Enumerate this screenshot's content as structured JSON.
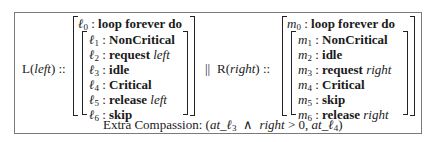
{
  "left_process": {
    "label_name": "L",
    "label_arg": "left",
    "label_suffix": " ::",
    "outer": {
      "loc": "ℓ",
      "idx": "0",
      "text": "loop forever do"
    },
    "inner": [
      {
        "loc": "ℓ",
        "idx": "1",
        "stmt": "NonCritical",
        "arg": ""
      },
      {
        "loc": "ℓ",
        "idx": "2",
        "stmt": "request",
        "arg": "left"
      },
      {
        "loc": "ℓ",
        "idx": "3",
        "stmt": "idle",
        "arg": ""
      },
      {
        "loc": "ℓ",
        "idx": "4",
        "stmt": "Critical",
        "arg": ""
      },
      {
        "loc": "ℓ",
        "idx": "5",
        "stmt": "release",
        "arg": "left"
      },
      {
        "loc": "ℓ",
        "idx": "6",
        "stmt": "skip",
        "arg": ""
      }
    ]
  },
  "parallel_operator": "||",
  "right_process": {
    "label_name": "R",
    "label_arg": "right",
    "label_suffix": " ::",
    "outer": {
      "loc": "m",
      "idx": "0",
      "text": "loop forever do"
    },
    "inner": [
      {
        "loc": "m",
        "idx": "1",
        "stmt": "NonCritical",
        "arg": ""
      },
      {
        "loc": "m",
        "idx": "2",
        "stmt": "idle",
        "arg": ""
      },
      {
        "loc": "m",
        "idx": "3",
        "stmt": "request",
        "arg": "right"
      },
      {
        "loc": "m",
        "idx": "4",
        "stmt": "Critical",
        "arg": ""
      },
      {
        "loc": "m",
        "idx": "5",
        "stmt": "skip",
        "arg": ""
      },
      {
        "loc": "m",
        "idx": "6",
        "stmt": "release",
        "arg": "right"
      }
    ]
  },
  "footer": {
    "label": "Extra Compassion:",
    "open": "(",
    "at1": "at_",
    "loc1": "ℓ",
    "idx1": "3",
    "and": "∧",
    "cond_var": "right",
    "cond_rest": " > 0,",
    "at2": "at_",
    "loc2": "ℓ",
    "idx2": "4",
    "close": ")"
  }
}
